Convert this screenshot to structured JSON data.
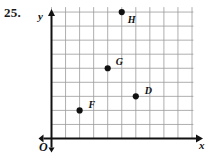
{
  "exercise": {
    "number": "25."
  },
  "chart_data": {
    "type": "scatter",
    "title": "",
    "xlabel": "x",
    "ylabel": "y",
    "origin_label": "O",
    "grid": true,
    "grid_step": 1,
    "xlim": [
      0,
      10
    ],
    "ylim": [
      0,
      9
    ],
    "xticks": [],
    "yticks": [],
    "legend": "none",
    "points": [
      {
        "label": "D",
        "x": 6,
        "y": 3,
        "label_dx": 9,
        "label_dy": -10
      },
      {
        "label": "F",
        "x": 2,
        "y": 2,
        "label_dx": 9,
        "label_dy": -10
      },
      {
        "label": "G",
        "x": 4,
        "y": 5,
        "label_dx": 8,
        "label_dy": -11
      },
      {
        "label": "H",
        "x": 5,
        "y": 9,
        "label_dx": 6,
        "label_dy": 3
      }
    ],
    "colors": {
      "point": "#111111",
      "grid": "#9a9a9a",
      "axis": "#111111",
      "background": "#ffffff"
    }
  }
}
